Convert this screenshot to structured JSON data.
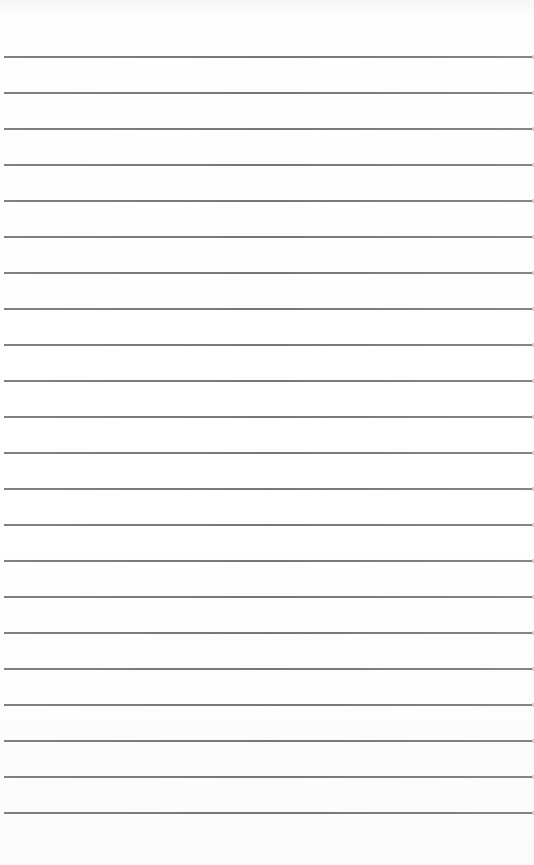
{
  "image": {
    "description": "Blank lined notebook paper",
    "background_color": "#ffffff",
    "line_color": "#646464",
    "line_count": 22,
    "first_line_y": 56,
    "line_spacing_px": 36
  }
}
